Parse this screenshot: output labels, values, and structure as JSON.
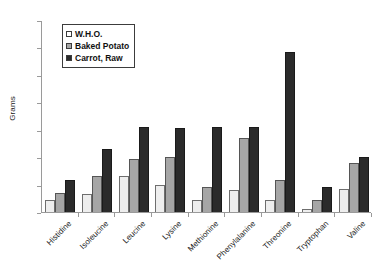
{
  "chart_data": {
    "type": "bar",
    "title": "",
    "xlabel": "",
    "ylabel": "Grams",
    "ylim": [
      0,
      14
    ],
    "ytick_step": 2,
    "yticks": [
      0,
      2,
      4,
      6,
      8,
      10,
      12,
      14
    ],
    "grid": false,
    "legend_position": "top-left-inside",
    "categories": [
      "Histidine",
      "Isoleucine",
      "Leucine",
      "Lysine",
      "Methionine",
      "Phenylalanine",
      "Threonine",
      "Tryptophan",
      "Valine"
    ],
    "series": [
      {
        "name": "W.H.O.",
        "color": "#eeeeee",
        "values": [
          0.9,
          1.3,
          2.6,
          2.0,
          0.9,
          1.6,
          0.9,
          0.25,
          1.7
        ]
      },
      {
        "name": "Baked Potato",
        "color": "#a6a6a6",
        "values": [
          1.4,
          2.6,
          3.9,
          4.0,
          1.8,
          5.4,
          2.3,
          0.9,
          3.6
        ]
      },
      {
        "name": "Carrot, Raw",
        "color": "#2b2b2b",
        "values": [
          2.3,
          4.6,
          6.2,
          6.1,
          6.2,
          6.2,
          11.7,
          1.8,
          4.0
        ]
      }
    ]
  },
  "axes": {
    "y_title": "Grams"
  },
  "colors": {
    "axis": "#9a9a9a",
    "text": "#1a1a1a",
    "frame": "#3c3c3c",
    "background": "#ffffff"
  }
}
